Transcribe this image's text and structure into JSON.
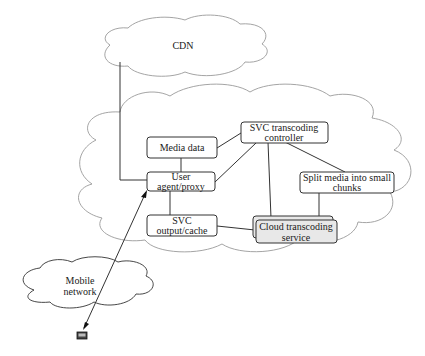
{
  "clouds": {
    "cdn": "CDN",
    "mobile": [
      "Mobile",
      "network"
    ]
  },
  "nodes": {
    "media_data": [
      "Media data"
    ],
    "controller": [
      "SVC transcoding",
      "controller"
    ],
    "user_agent": [
      "User",
      "agent/proxy"
    ],
    "split_media": [
      "Split media into small",
      "chunks"
    ],
    "svc_output": [
      "SVC",
      "output/cache"
    ],
    "cloud_service": [
      "Cloud transcoding",
      "service"
    ]
  },
  "icons": {
    "device": "mobile-device-icon"
  }
}
